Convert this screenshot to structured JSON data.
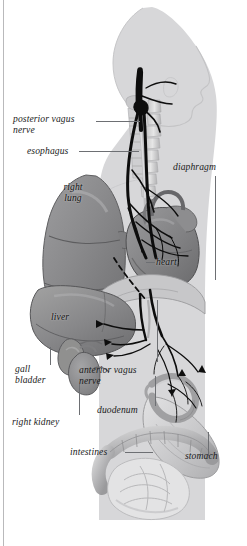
{
  "figure": {
    "style": "grayscale medical illustration",
    "background_color": "#ffffff",
    "silhouette_color": "#d7d7d9",
    "nerve_color": "#0d0d0d",
    "label_color": "#1b1b1b",
    "leader_color": "#6d6f73",
    "width": 247,
    "height": 546
  },
  "labels": [
    {
      "id": "posterior-vagus-nerve",
      "text": "posterior vagus\nnerve",
      "lines": 2
    },
    {
      "id": "esophagus",
      "text": "esophagus",
      "lines": 1
    },
    {
      "id": "diaphragm",
      "text": "diaphragm",
      "lines": 1
    },
    {
      "id": "right-lung",
      "text": "right\nlung",
      "lines": 2
    },
    {
      "id": "heart",
      "text": "heart",
      "lines": 1
    },
    {
      "id": "liver",
      "text": "liver",
      "lines": 1
    },
    {
      "id": "gall-bladder",
      "text": "gall\nbladder",
      "lines": 2
    },
    {
      "id": "right-kidney",
      "text": "right kidney",
      "lines": 1
    },
    {
      "id": "anterior-vagus-nerve",
      "text": "anterior vagus\nnerve",
      "lines": 2
    },
    {
      "id": "duodenum",
      "text": "duodenum",
      "lines": 1
    },
    {
      "id": "intestines",
      "text": "intestines",
      "lines": 1
    },
    {
      "id": "stomach",
      "text": "stomach",
      "lines": 1
    }
  ]
}
